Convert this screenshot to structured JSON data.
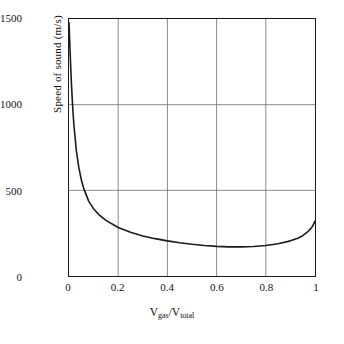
{
  "chart_data": {
    "type": "line",
    "title": "",
    "xlabel": "V_gas/V_total",
    "xlabel_main": "V",
    "xlabel_sub1": "gas",
    "xlabel_slash": "/V",
    "xlabel_sub2": "total",
    "ylabel_main": "Speed of sound",
    "ylabel_units": "(m/s)",
    "ylabel": "Speed of sound (m/s)",
    "xlim": [
      0,
      1
    ],
    "ylim": [
      0,
      1500
    ],
    "xticks": [
      0,
      0.2,
      0.4,
      0.6,
      0.8,
      1
    ],
    "xtick_labels": [
      "0",
      "0.2",
      "0.4",
      "0.6",
      "0.8",
      "1"
    ],
    "yticks": [
      0,
      500,
      1000,
      1500
    ],
    "ytick_labels": [
      "0",
      "500",
      "1000",
      "1500"
    ],
    "grid": true,
    "grid_color": "#6e6e6e",
    "axis_color": "#1a1a1a",
    "line_color": "#1a1a1a",
    "legend": null,
    "series": [
      {
        "name": "speed of sound",
        "x": [
          0.0,
          0.005,
          0.01,
          0.015,
          0.02,
          0.03,
          0.04,
          0.05,
          0.06,
          0.08,
          0.1,
          0.12,
          0.15,
          0.2,
          0.25,
          0.3,
          0.35,
          0.4,
          0.45,
          0.5,
          0.55,
          0.6,
          0.65,
          0.7,
          0.75,
          0.8,
          0.85,
          0.9,
          0.93,
          0.95,
          0.97,
          0.98,
          0.99,
          1.0
        ],
        "y": [
          1480,
          1290,
          1120,
          985,
          880,
          730,
          632,
          562,
          510,
          437,
          392,
          360,
          325,
          283,
          255,
          234,
          218,
          205,
          194,
          185,
          178,
          173,
          170,
          170,
          172,
          178,
          188,
          205,
          220,
          235,
          258,
          272,
          290,
          320
        ]
      }
    ]
  },
  "axis": {
    "xtick_labels": [
      "0",
      "0.2",
      "0.4",
      "0.6",
      "0.8",
      "1"
    ],
    "ytick_labels": [
      "0",
      "500",
      "1000",
      "1500"
    ]
  }
}
